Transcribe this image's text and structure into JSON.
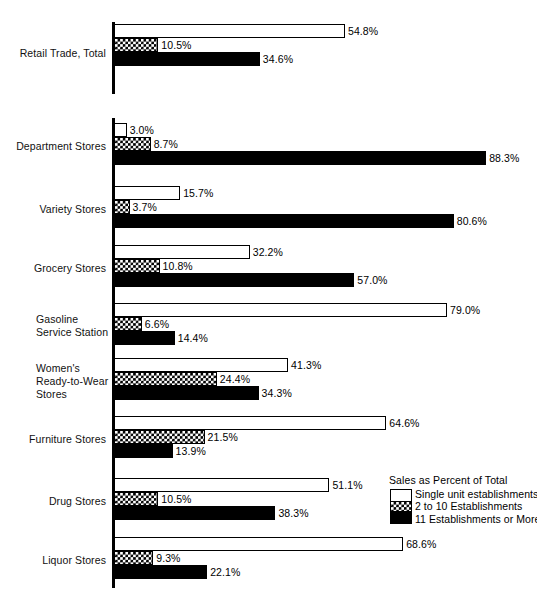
{
  "chart_data": {
    "type": "bar",
    "orientation": "horizontal",
    "title": "",
    "xlabel": "",
    "ylabel": "",
    "xlim": [
      0,
      100
    ],
    "grid": false,
    "value_suffix": "%",
    "legend_position": "inside-bottom-right",
    "categories": [
      "Retail Trade, Total",
      "Department Stores",
      "Variety Stores",
      "Grocery Stores",
      "Gasoline\nService Station",
      "Women's\nReady-to-Wear\nStores",
      "Furniture Stores",
      "Drug Stores",
      "Liquor Stores"
    ],
    "series": [
      {
        "name": "Single unit establishments",
        "fill": "white",
        "values": [
          54.8,
          3.0,
          15.7,
          32.2,
          79.0,
          41.3,
          64.6,
          51.1,
          68.6
        ],
        "labels": [
          "54.8%",
          "3.0%",
          "15.7%",
          "32.2%",
          "79.0%",
          "41.3%",
          "64.6%",
          "51.1%",
          "68.6%"
        ]
      },
      {
        "name": "2 to 10 Establishments",
        "fill": "checker",
        "values": [
          10.5,
          8.7,
          3.7,
          10.8,
          6.6,
          24.4,
          21.5,
          10.5,
          9.3
        ],
        "labels": [
          "10.5%",
          "8.7%",
          "3.7%",
          "10.8%",
          "6.6%",
          "24.4%",
          "21.5%",
          "10.5%",
          "9.3%"
        ]
      },
      {
        "name": "11 Establishments or More",
        "fill": "black",
        "values": [
          34.6,
          88.3,
          80.6,
          57.0,
          14.4,
          34.3,
          13.9,
          38.3,
          22.1
        ],
        "labels": [
          "34.6%",
          "88.3%",
          "80.6%",
          "57.0%",
          "14.4%",
          "34.3%",
          "13.9%",
          "38.3%",
          "22.1%"
        ]
      }
    ]
  },
  "legend": {
    "title": "Sales as Percent of Total",
    "items": [
      "Single unit establishments",
      "2 to 10 Establishments",
      "11 Establishments or More"
    ]
  },
  "colors": {
    "bar_outline": "#000000",
    "bar_single_fill": "#ffffff",
    "bar_eleven_fill": "#000000",
    "axis": "#000000",
    "text": "#000000",
    "background": "#ffffff"
  },
  "layout": {
    "axis_x": 114,
    "px_per_percent": 4.215,
    "groups": [
      {
        "top": 24,
        "label_top": 47
      },
      {
        "top": 123,
        "label_top": 140
      },
      {
        "top": 186,
        "label_top": 203
      },
      {
        "top": 245,
        "label_top": 262
      },
      {
        "top": 303,
        "label_top": 313
      },
      {
        "top": 358,
        "label_top": 362
      },
      {
        "top": 416,
        "label_top": 433
      },
      {
        "top": 478,
        "label_top": 495
      },
      {
        "top": 537,
        "label_top": 554
      }
    ],
    "axis_segments": [
      {
        "top": 22,
        "height": 72
      },
      {
        "top": 118,
        "height": 470
      }
    ]
  }
}
